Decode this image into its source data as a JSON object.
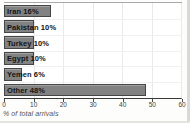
{
  "chart_data": {
    "type": "bar",
    "orientation": "horizontal",
    "title": "",
    "categories": [
      "Iran",
      "Pakistan",
      "Turkey",
      "Egypt",
      "Yemen",
      "Other"
    ],
    "values": [
      16,
      10,
      10,
      10,
      6,
      48
    ],
    "bar_labels": [
      "Iran 16%",
      "Pakistan 10%",
      "Turkey 10%",
      "Egypt 10%",
      "Yemen 6%",
      "Other 48%"
    ],
    "xlabel": "% of total arrivals",
    "ylabel": "",
    "xlim": [
      0,
      60
    ],
    "xticks": [
      0,
      10,
      20,
      30,
      40,
      50,
      60
    ],
    "grid": true,
    "legend": false,
    "colors": {
      "bar_fill": "#828282",
      "bar_border": "#454545",
      "label_text": "#141414",
      "gridline": "#e9e9e9",
      "axis_line": "#3a3a3a",
      "tick_text": "#3f3f3f",
      "caption_text": "#555555"
    }
  }
}
